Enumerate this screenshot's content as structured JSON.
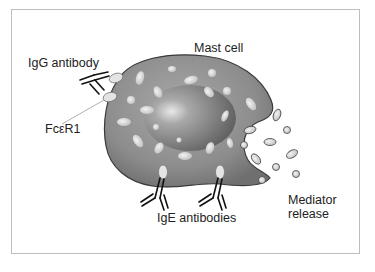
{
  "diagram": {
    "labels": {
      "igg": "IgG antibody",
      "mast_cell": "Mast cell",
      "receptor": "FcεR1",
      "ige": "IgE antibodies",
      "mediator_line1": "Mediator",
      "mediator_line2": "release"
    },
    "colors": {
      "cell_fill": "#8a8a8a",
      "cell_edge": "#3a3a3a",
      "granule": "#d6d6d6",
      "nucleus": "#6e6e6e",
      "frame": "#bdbdbd",
      "text": "#222222"
    }
  }
}
